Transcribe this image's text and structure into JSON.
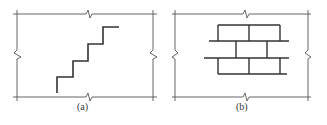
{
  "figure": {
    "panels": [
      {
        "id": "a",
        "caption": "(a)",
        "pattern": "stepped-crack",
        "description": "staircase line inside wall panel with break symbols"
      },
      {
        "id": "b",
        "caption": "(b)",
        "pattern": "brick-bond",
        "description": "running bond brick pattern inside wall panel with break symbols"
      }
    ],
    "colors": {
      "line": "#444444",
      "thick_line": "#333333",
      "background": "#ffffff"
    }
  }
}
